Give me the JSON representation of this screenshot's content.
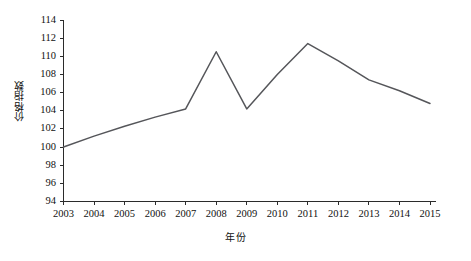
{
  "chart_data": {
    "type": "line",
    "title": "",
    "xlabel": "年份",
    "ylabel": "价格指数",
    "categories": [
      "2003",
      "2004",
      "2005",
      "2006",
      "2007",
      "2008",
      "2009",
      "2010",
      "2011",
      "2012",
      "2013",
      "2014",
      "2015"
    ],
    "values": [
      100.0,
      101.2,
      102.3,
      103.3,
      104.2,
      110.5,
      104.2,
      108.0,
      111.4,
      109.5,
      107.4,
      106.2,
      104.8
    ],
    "series": [
      {
        "name": "价格指数",
        "values": [
          100.0,
          101.2,
          102.3,
          103.3,
          104.2,
          110.5,
          104.2,
          108.0,
          111.4,
          109.5,
          107.4,
          106.2,
          104.8
        ]
      }
    ],
    "ylim": [
      94,
      114
    ],
    "ytick_labels": [
      "94",
      "96",
      "98",
      "100",
      "102",
      "104",
      "106",
      "108",
      "110",
      "112",
      "114"
    ],
    "ytick_values": [
      94,
      96,
      98,
      100,
      102,
      104,
      106,
      108,
      110,
      112,
      114
    ],
    "xtick_labels": [
      "2003",
      "2004",
      "2005",
      "2006",
      "2007",
      "2008",
      "2009",
      "2010",
      "2011",
      "2012",
      "2013",
      "2014",
      "2015"
    ],
    "grid": false,
    "legend": false,
    "legend_position": "none",
    "line_color": "#55565a",
    "axis_color": "#2b2b2b"
  }
}
